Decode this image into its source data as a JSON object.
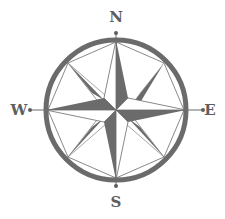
{
  "figure": {
    "center": [
      116,
      110
    ],
    "ring": {
      "radius": 70,
      "stroke_width": 5,
      "color": "#6b6b6b"
    },
    "colors": {
      "dark": "#6b6b6b",
      "light": "#ffffff",
      "line": "#6b6b6b",
      "label": "#5e5e5e"
    },
    "directions": {
      "north": {
        "label": "N",
        "x": 116,
        "y": 22
      },
      "east": {
        "label": "E",
        "x": 210,
        "y": 115
      },
      "south": {
        "label": "S",
        "x": 116,
        "y": 207
      },
      "west": {
        "label": "W",
        "x": 19,
        "y": 115
      }
    }
  }
}
